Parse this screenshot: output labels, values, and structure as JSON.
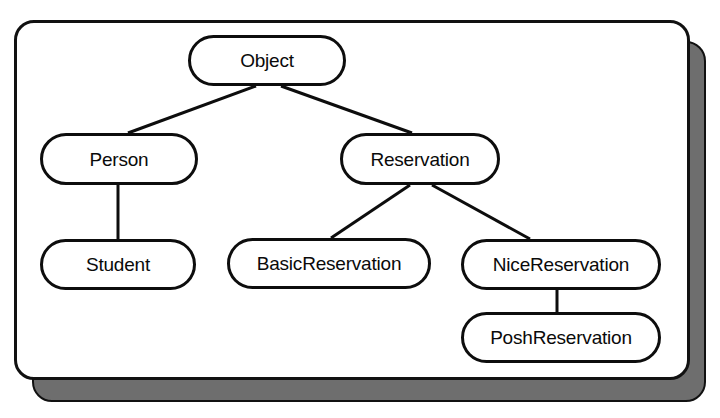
{
  "diagram": {
    "type": "tree",
    "style": {
      "node_shape": "stadium",
      "node_fill": "#ffffff",
      "node_stroke": "#0d0d0d",
      "panel_fill": "#ffffff",
      "panel_stroke": "#111111",
      "shadow_fill": "#6e6e6e",
      "edge_stroke": "#0d0d0d",
      "background": "#ffffff"
    },
    "nodes": [
      {
        "id": "object",
        "label": "Object",
        "level": 0,
        "x": 267,
        "y": 60
      },
      {
        "id": "person",
        "label": "Person",
        "level": 1,
        "x": 119,
        "y": 159
      },
      {
        "id": "reservation",
        "label": "Reservation",
        "level": 1,
        "x": 420,
        "y": 159
      },
      {
        "id": "student",
        "label": "Student",
        "level": 2,
        "x": 118,
        "y": 264
      },
      {
        "id": "basicres",
        "label": "BasicReservation",
        "level": 2,
        "x": 329,
        "y": 263
      },
      {
        "id": "niceres",
        "label": "NiceReservation",
        "level": 2,
        "x": 561,
        "y": 264
      },
      {
        "id": "poshres",
        "label": "PoshReservation",
        "level": 3,
        "x": 561,
        "y": 337
      }
    ],
    "edges": [
      {
        "from": "object",
        "to": "person",
        "kind": "inheritance"
      },
      {
        "from": "object",
        "to": "reservation",
        "kind": "inheritance"
      },
      {
        "from": "person",
        "to": "student",
        "kind": "inheritance"
      },
      {
        "from": "reservation",
        "to": "basicres",
        "kind": "inheritance"
      },
      {
        "from": "reservation",
        "to": "niceres",
        "kind": "inheritance"
      },
      {
        "from": "niceres",
        "to": "poshres",
        "kind": "inheritance"
      }
    ]
  }
}
